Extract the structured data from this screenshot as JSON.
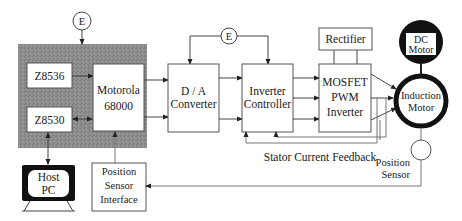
{
  "diagram": {
    "colors": {
      "background": "#ffffff",
      "processor_panel": "#8f8f8f",
      "line": "#444444",
      "box_fill": "#ffffff",
      "motor_fill": "#111111"
    },
    "processor_panel": {
      "label": "",
      "blocks": {
        "z8536": "Z8536",
        "z8530": "Z8530",
        "motorola_line1": "Motorola",
        "motorola_line2": "68000"
      }
    },
    "encoder_left": "E",
    "encoder_top": "E",
    "da_converter": {
      "line1": "D / A",
      "line2": "Converter"
    },
    "inverter_controller": {
      "line1": "Inverter",
      "line2": "Controller"
    },
    "rectifier": "Rectifier",
    "mosfet_inverter": {
      "line1": "MOSFET",
      "line2": "PWM",
      "line3": "Inverter"
    },
    "dc_motor": {
      "line1": "DC",
      "line2": "Motor"
    },
    "induction_motor": {
      "line1": "Induction",
      "line2": "Motor"
    },
    "host_pc": {
      "line1": "Host",
      "line2": "PC"
    },
    "position_sensor_interface": {
      "line1": "Position",
      "line2": "Sensor",
      "line3": "Interface"
    },
    "position_sensor": {
      "line1": "Position",
      "line2": "Sensor"
    },
    "stator_feedback_label": "Stator Current Feedback"
  }
}
